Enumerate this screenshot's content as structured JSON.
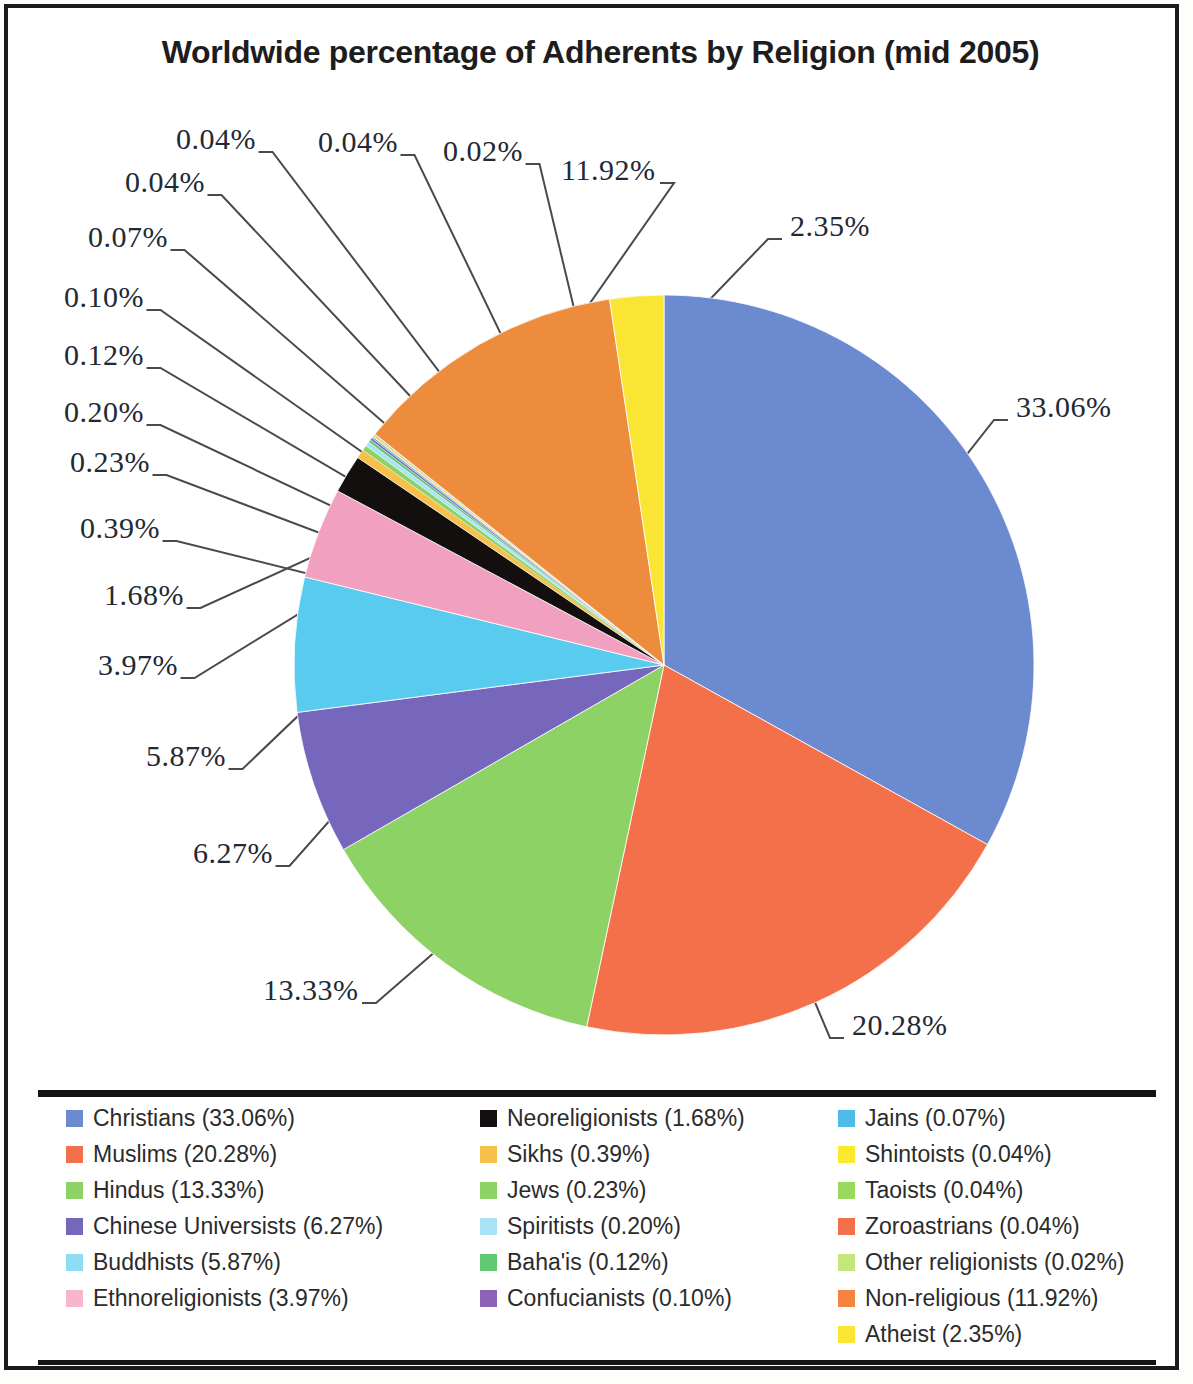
{
  "title": "Worldwide percentage of Adherents by Religion (mid 2005)",
  "chart_data": {
    "type": "pie",
    "title": "Worldwide percentage of Adherents by Religion (mid 2005)",
    "unit": "percent",
    "legend_position": "bottom",
    "labels": [
      "Christians",
      "Muslims",
      "Hindus",
      "Chinese Universists",
      "Buddhists",
      "Ethnoreligionists",
      "Neoreligionists",
      "Sikhs",
      "Jews",
      "Spiritists",
      "Baha'is",
      "Confucianists",
      "Jains",
      "Shintoists",
      "Taoists",
      "Zoroastrians",
      "Other religionists",
      "Non-religious",
      "Atheist"
    ],
    "values": [
      33.06,
      20.28,
      13.33,
      6.27,
      5.87,
      3.97,
      1.68,
      0.39,
      0.23,
      0.2,
      0.12,
      0.1,
      0.07,
      0.04,
      0.04,
      0.04,
      0.02,
      11.92,
      2.35
    ],
    "colors": [
      "#6B8AD0",
      "#F4704A",
      "#8CD264",
      "#7767BC",
      "#58CBEE",
      "#F2A0C0",
      "#120F0E",
      "#F7C04A",
      "#8CD264",
      "#A8E4F5",
      "#63C873",
      "#8C63B5",
      "#4FBBE8",
      "#FBE92E",
      "#9BD95E",
      "#F4704A",
      "#C3E77A",
      "#ED8C3C",
      "#FAE535"
    ],
    "slice_labels": [
      "33.06%",
      "20.28%",
      "13.33%",
      "6.27%",
      "5.87%",
      "3.97%",
      "1.68%",
      "0.39%",
      "0.23%",
      "0.20%",
      "0.12%",
      "0.10%",
      "0.07%",
      "0.04%",
      "0.04%",
      "0.04%",
      "0.02%",
      "11.92%",
      "2.35%"
    ]
  },
  "legend": {
    "columns": [
      {
        "items": [
          {
            "label": "Christians (33.06%)",
            "color": "#6B8AD0",
            "name": "christians"
          },
          {
            "label": "Muslims (20.28%)",
            "color": "#F4704A",
            "name": "muslims"
          },
          {
            "label": "Hindus (13.33%)",
            "color": "#8CD264",
            "name": "hindus"
          },
          {
            "label": "Chinese Universists (6.27%)",
            "color": "#7767BC",
            "name": "chinese-universists"
          },
          {
            "label": "Buddhists (5.87%)",
            "color": "#8CDDF2",
            "name": "buddhists"
          },
          {
            "label": "Ethnoreligionists (3.97%)",
            "color": "#F7B5CE",
            "name": "ethnoreligionists"
          }
        ]
      },
      {
        "items": [
          {
            "label": "Neoreligionists (1.68%)",
            "color": "#120F0E",
            "name": "neoreligionists"
          },
          {
            "label": "Sikhs (0.39%)",
            "color": "#F7C04A",
            "name": "sikhs"
          },
          {
            "label": "Jews (0.23%)",
            "color": "#8CD264",
            "name": "jews"
          },
          {
            "label": "Spiritists (0.20%)",
            "color": "#A8E4F5",
            "name": "spiritists"
          },
          {
            "label": "Baha'is (0.12%)",
            "color": "#63C873",
            "name": "bahais"
          },
          {
            "label": "Confucianists (0.10%)",
            "color": "#8C63B5",
            "name": "confucianists"
          }
        ]
      },
      {
        "items": [
          {
            "label": "Jains (0.07%)",
            "color": "#4FBBE8",
            "name": "jains"
          },
          {
            "label": "Shintoists (0.04%)",
            "color": "#FBE92E",
            "name": "shintoists"
          },
          {
            "label": "Taoists (0.04%)",
            "color": "#9BD95E",
            "name": "taoists"
          },
          {
            "label": "Zoroastrians (0.04%)",
            "color": "#F4704A",
            "name": "zoroastrians"
          },
          {
            "label": "Other religionists (0.02%)",
            "color": "#C3E77A",
            "name": "other-religionists"
          },
          {
            "label": "Non-religious (11.92%)",
            "color": "#F4843F",
            "name": "non-religious"
          },
          {
            "label": "Atheist (2.35%)",
            "color": "#FAE535",
            "name": "atheist"
          }
        ]
      }
    ]
  },
  "callouts": [
    {
      "text": "0.04%",
      "x": 168,
      "y": 114,
      "name": "callout-taoists"
    },
    {
      "text": "0.04%",
      "x": 310,
      "y": 117,
      "name": "callout-shintoists"
    },
    {
      "text": "0.02%",
      "x": 435,
      "y": 126,
      "name": "callout-other-religionists"
    },
    {
      "text": "11.92%",
      "x": 553,
      "y": 145,
      "name": "callout-non-religious"
    },
    {
      "text": "2.35%",
      "x": 782,
      "y": 201,
      "name": "callout-atheist"
    },
    {
      "text": "0.04%",
      "x": 117,
      "y": 157,
      "name": "callout-zoroastrians"
    },
    {
      "text": "0.07%",
      "x": 80,
      "y": 212,
      "name": "callout-jains"
    },
    {
      "text": "0.10%",
      "x": 56,
      "y": 272,
      "name": "callout-confucianists"
    },
    {
      "text": "0.12%",
      "x": 56,
      "y": 330,
      "name": "callout-bahais"
    },
    {
      "text": "0.20%",
      "x": 56,
      "y": 387,
      "name": "callout-spiritists"
    },
    {
      "text": "0.23%",
      "x": 62,
      "y": 437,
      "name": "callout-jews"
    },
    {
      "text": "0.39%",
      "x": 72,
      "y": 503,
      "name": "callout-sikhs"
    },
    {
      "text": "1.68%",
      "x": 96,
      "y": 570,
      "name": "callout-neoreligionists"
    },
    {
      "text": "3.97%",
      "x": 90,
      "y": 640,
      "name": "callout-ethnoreligionists"
    },
    {
      "text": "5.87%",
      "x": 138,
      "y": 731,
      "name": "callout-buddhists"
    },
    {
      "text": "6.27%",
      "x": 185,
      "y": 828,
      "name": "callout-chinese-universists"
    },
    {
      "text": "13.33%",
      "x": 255,
      "y": 965,
      "name": "callout-hindus"
    },
    {
      "text": "20.28%",
      "x": 844,
      "y": 1000,
      "name": "callout-muslims"
    },
    {
      "text": "33.06%",
      "x": 1008,
      "y": 382,
      "name": "callout-christians"
    }
  ]
}
